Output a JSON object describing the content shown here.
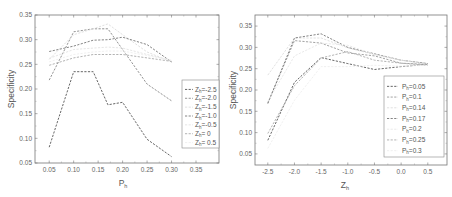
{
  "chart_data": [
    {
      "type": "line",
      "title": "",
      "xlabel": "P_h",
      "ylabel": "Specificity",
      "xlim": [
        0.021,
        0.397
      ],
      "ylim": [
        0.05,
        0.35
      ],
      "xticks": [
        0.05,
        0.1,
        0.15,
        0.2,
        0.25,
        0.3,
        0.35
      ],
      "xtick_labels": [
        "0.05",
        "0.10",
        "0.15",
        "0.20",
        "0.25",
        "0.30",
        "0.35"
      ],
      "yticks": [
        0.05,
        0.1,
        0.15,
        0.2,
        0.25,
        0.3,
        0.35
      ],
      "ytick_labels": [
        "0.05",
        "0.10",
        "0.15",
        "0.20",
        "0.25",
        "0.30",
        "0.35"
      ],
      "grid": false,
      "legend_position": "center right",
      "x": [
        0.05,
        0.1,
        0.14,
        0.17,
        0.2,
        0.25,
        0.3
      ],
      "series": [
        {
          "name": "Z_h=-2.5",
          "color": "#555555",
          "values": [
            0.082,
            0.235,
            0.235,
            0.168,
            0.173,
            0.098,
            0.063
          ]
        },
        {
          "name": "Z_h=-2.0",
          "color": "#888888",
          "values": [
            0.218,
            0.316,
            0.322,
            0.322,
            0.28,
            0.21,
            0.176
          ]
        },
        {
          "name": "Z_h=-1.5",
          "color": "#dddddd",
          "values": [
            0.26,
            0.31,
            0.322,
            0.332,
            0.31,
            0.275,
            0.255
          ]
        },
        {
          "name": "Z_h=-1.0",
          "color": "#777777",
          "values": [
            0.276,
            0.287,
            0.299,
            0.3,
            0.305,
            0.29,
            0.255
          ]
        },
        {
          "name": "Z_h=-0.5",
          "color": "#e2e2e2",
          "values": [
            0.262,
            0.28,
            0.283,
            0.285,
            0.283,
            0.27,
            0.258
          ]
        },
        {
          "name": "Z_h=0",
          "color": "#aaaaaa",
          "values": [
            0.248,
            0.263,
            0.27,
            0.27,
            0.27,
            0.263,
            0.256
          ]
        },
        {
          "name": "Z_h=0.5",
          "color": "#eeeeee",
          "values": [
            0.255,
            0.27,
            0.275,
            0.277,
            0.277,
            0.268,
            0.258
          ]
        }
      ]
    },
    {
      "type": "line",
      "title": "",
      "xlabel": "Z_h",
      "ylabel": "Specificity",
      "xlim": [
        -2.74,
        0.86
      ],
      "ylim": [
        0.024,
        0.376
      ],
      "xticks": [
        -2.5,
        -2.0,
        -1.5,
        -1.0,
        -0.5,
        0.0,
        0.5
      ],
      "xtick_labels": [
        "-2.5",
        "-2.0",
        "-1.5",
        "-1.0",
        "-0.5",
        "0.0",
        "0.5"
      ],
      "yticks": [
        0.05,
        0.1,
        0.15,
        0.2,
        0.25,
        0.3,
        0.35
      ],
      "ytick_labels": [
        "0.05",
        "0.10",
        "0.15",
        "0.20",
        "0.25",
        "0.30",
        "0.35"
      ],
      "grid": false,
      "legend_position": "lower right",
      "x": [
        -2.5,
        -2.0,
        -1.5,
        -1.0,
        -0.5,
        0.0,
        0.5
      ],
      "series": [
        {
          "name": "P_h=0.05",
          "color": "#555555",
          "values": [
            0.082,
            0.218,
            0.276,
            0.262,
            0.248,
            0.255,
            0.26
          ]
        },
        {
          "name": "P_h=0.1",
          "color": "#999999",
          "values": [
            0.17,
            0.316,
            0.31,
            0.287,
            0.28,
            0.263,
            0.26
          ]
        },
        {
          "name": "P_h=0.14",
          "color": "#dddddd",
          "values": [
            0.235,
            0.322,
            0.322,
            0.299,
            0.283,
            0.27,
            0.262
          ]
        },
        {
          "name": "P_h=0.17",
          "color": "#777777",
          "values": [
            0.168,
            0.322,
            0.332,
            0.3,
            0.285,
            0.27,
            0.262
          ]
        },
        {
          "name": "P_h=0.2",
          "color": "#e6e6e6",
          "values": [
            0.173,
            0.28,
            0.31,
            0.305,
            0.283,
            0.27,
            0.26
          ]
        },
        {
          "name": "P_h=0.25",
          "color": "#aaaaaa",
          "values": [
            0.098,
            0.21,
            0.275,
            0.29,
            0.27,
            0.263,
            0.258
          ]
        },
        {
          "name": "P_h=0.3",
          "color": "#eeeeee",
          "values": [
            0.063,
            0.176,
            0.255,
            0.255,
            0.258,
            0.256,
            0.258
          ]
        }
      ]
    }
  ],
  "left_chart": {
    "ylabel": "Specificity",
    "xlabel_main": "P",
    "xlabel_sub": "h",
    "legend": [
      {
        "main": "Z",
        "sub": "h",
        "rest": "=-2.5"
      },
      {
        "main": "Z",
        "sub": "h",
        "rest": "=-2.0"
      },
      {
        "main": "Z",
        "sub": "h",
        "rest": "=-1.5"
      },
      {
        "main": "Z",
        "sub": "h",
        "rest": "=-1.0"
      },
      {
        "main": "Z",
        "sub": "h",
        "rest": "=-0.5"
      },
      {
        "main": "Z",
        "sub": "h",
        "rest": "= 0"
      },
      {
        "main": "Z",
        "sub": "h",
        "rest": "= 0.5"
      }
    ]
  },
  "right_chart": {
    "ylabel": "Specificity",
    "xlabel_main": "Z",
    "xlabel_sub": "h",
    "legend": [
      {
        "main": "P",
        "sub": "h",
        "rest": "=0.05"
      },
      {
        "main": "P",
        "sub": "h",
        "rest": "=0.1"
      },
      {
        "main": "P",
        "sub": "h",
        "rest": "=0.14"
      },
      {
        "main": "P",
        "sub": "h",
        "rest": "=0.17"
      },
      {
        "main": "P",
        "sub": "h",
        "rest": "=0.2"
      },
      {
        "main": "P",
        "sub": "h",
        "rest": "=0.25"
      },
      {
        "main": "P",
        "sub": "h",
        "rest": "=0.3"
      }
    ]
  }
}
